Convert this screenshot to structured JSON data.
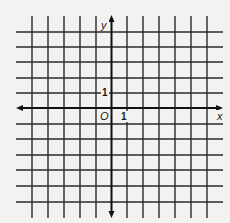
{
  "diagram": {
    "type": "coordinate-grid",
    "axes": {
      "x_label": "x",
      "y_label": "y",
      "origin_label": "O",
      "x_unit_label": "1",
      "y_unit_label": "1"
    },
    "grid": {
      "columns_left_of_y_axis": 5,
      "columns_right_of_y_axis": 6,
      "rows_above_x_axis": 5,
      "rows_below_x_axis": 6,
      "line_color": "#2a2a2a",
      "axis_color": "#111111",
      "background": "#f2f2f0"
    }
  }
}
